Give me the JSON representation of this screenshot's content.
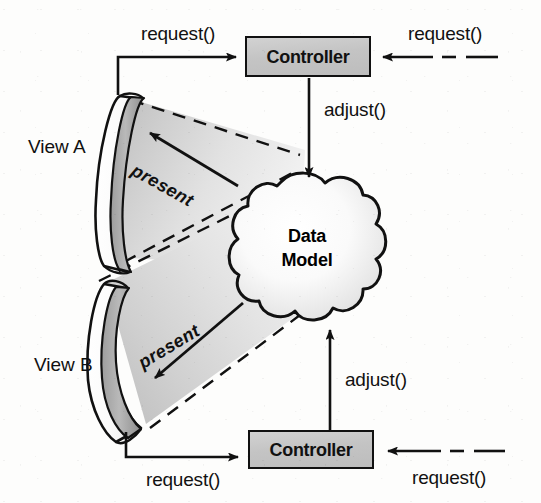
{
  "diagram": {
    "type": "architecture-diagram",
    "background_color": "#fdfdfc",
    "line_color": "#111111",
    "box_fill_color": "#c6c6c6",
    "cone_fill_color": "#d9d9d9"
  },
  "nodes": {
    "view_a_label": "View A",
    "view_b_label": "View B",
    "controller_top_label": "Controller",
    "controller_bottom_label": "Controller",
    "data_model_line1": "Data",
    "data_model_line2": "Model"
  },
  "edges": {
    "request_view_a_to_controller": "request()",
    "request_external_to_controller_top": "request()",
    "adjust_controller_top_to_model": "adjust()",
    "present_model_to_view_a": "present",
    "present_model_to_view_b": "present",
    "adjust_controller_bottom_to_model": "adjust()",
    "request_view_b_to_controller": "request()",
    "request_external_to_controller_bottom": "request()"
  }
}
